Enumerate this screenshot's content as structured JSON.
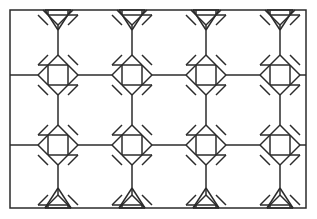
{
  "figure": {
    "background_color": "#ffffff",
    "stroke_color": "#2b2b2b",
    "stroke_width": 1.5,
    "frame_stroke_width": 1.5,
    "canvas": {
      "width": 317,
      "height": 219
    }
  },
  "frame": {
    "x": 10,
    "y": 10,
    "width": 296,
    "height": 198,
    "stroke": "#2b2b2b"
  },
  "lattice": {
    "columns_x": [
      58,
      132,
      206,
      280
    ],
    "rows_y": [
      75,
      145
    ],
    "column_spacing": 74,
    "row_spacing": 70,
    "node_count": 8
  },
  "node": {
    "type": "square-with-four-triangles",
    "square_half": 10,
    "tip_offset": 20,
    "label": "star node"
  },
  "edges": {
    "top_triangles_y_base": 10,
    "top_triangles_apex_y": 30,
    "bottom_triangles_y_base": 208,
    "bottom_triangles_apex_y": 188,
    "triangle_half_width": 13,
    "left_connector_x": 10,
    "right_connector_x": 306
  },
  "chart_data": {
    "type": "diagram",
    "xlabel": "",
    "ylabel": "",
    "grid": false,
    "legend": null,
    "elements": [
      {
        "name": "outer-frame",
        "shape": "rectangle",
        "x": 10,
        "y": 10,
        "w": 296,
        "h": 198
      },
      {
        "name": "star-node",
        "shape": "square+4 triangles",
        "count": 8
      },
      {
        "name": "edge-triangle-top",
        "shape": "triangle-down",
        "count": 4
      },
      {
        "name": "edge-triangle-bottom",
        "shape": "triangle-up",
        "count": 4
      },
      {
        "name": "octagon-cell",
        "shape": "octagon",
        "count": 12
      }
    ]
  }
}
